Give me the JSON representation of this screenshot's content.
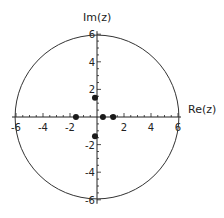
{
  "chart_data": {
    "type": "scatter",
    "title": "",
    "xlabel": "Re(z)",
    "ylabel": "Im(z)",
    "xlim": [
      -6,
      6
    ],
    "ylim": [
      -6,
      6
    ],
    "x_ticks": [
      -6,
      -4,
      -2,
      2,
      4,
      6
    ],
    "y_ticks": [
      -6,
      -4,
      -2,
      2,
      4,
      6
    ],
    "x_tick_labels": [
      "-6",
      "-4",
      "-2",
      "2",
      "4",
      "6"
    ],
    "y_tick_labels": [
      "-6",
      "-4",
      "-2",
      "2",
      "4",
      "6"
    ],
    "minor_tick_step": 0.5,
    "grid": false,
    "circle": {
      "center": [
        0,
        0
      ],
      "radius": 6
    },
    "points": [
      {
        "x": -1.56,
        "y": 0
      },
      {
        "x": 0.44,
        "y": 0
      },
      {
        "x": 1.2,
        "y": 0
      },
      {
        "x": -0.15,
        "y": 1.4
      },
      {
        "x": -0.15,
        "y": -1.4
      }
    ],
    "colors": {
      "axis": "#222222",
      "circle": "#333333",
      "point": "#1a1a1a"
    }
  }
}
